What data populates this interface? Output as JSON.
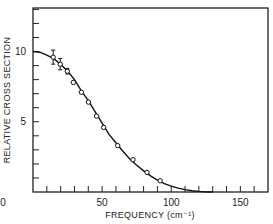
{
  "chart_data": {
    "type": "scatter",
    "title": "",
    "xlabel": "FREQUENCY (cm⁻¹)",
    "ylabel": "RELATIVE CROSS SECTION",
    "xlim": [
      0,
      170
    ],
    "ylim": [
      0,
      13.1
    ],
    "x_tick_labels": [
      "0",
      "50",
      "100",
      "150"
    ],
    "x_ticks": [
      0,
      50,
      100,
      150
    ],
    "x_minor_tick_step": 10,
    "y_tick_labels": [
      "0",
      "5",
      "10"
    ],
    "y_ticks": [
      0,
      5,
      10
    ],
    "y_minor_tick_step": 1,
    "grid": false,
    "legend": null,
    "series": [
      {
        "name": "measured",
        "marker": "open-circle",
        "x": [
          14.6,
          19.7,
          24.8,
          29.2,
          35.0,
          40.1,
          46.0,
          51.1,
          61.3,
          72.3,
          82.5,
          92.0
        ],
        "y": [
          9.6,
          9.1,
          8.6,
          7.8,
          7.1,
          6.4,
          5.4,
          4.6,
          3.3,
          2.3,
          1.4,
          0.8
        ],
        "error_bars": [
          0.5,
          0.4,
          0.2,
          0,
          0,
          0,
          0,
          0,
          0,
          0,
          0,
          0
        ]
      },
      {
        "name": "fit",
        "style": "solid-line",
        "x": [
          0,
          5,
          10,
          15,
          20,
          25,
          30,
          35,
          40,
          45,
          50,
          55,
          60,
          65,
          70,
          75,
          80,
          85,
          90,
          95,
          100,
          105,
          110,
          115,
          120,
          125,
          130
        ],
        "y": [
          10.0,
          9.95,
          9.75,
          9.5,
          9.1,
          8.6,
          8.0,
          7.2,
          6.5,
          5.7,
          4.9,
          4.1,
          3.5,
          2.9,
          2.35,
          1.9,
          1.5,
          1.15,
          0.85,
          0.6,
          0.42,
          0.28,
          0.17,
          0.09,
          0.04,
          0.01,
          0.0
        ]
      }
    ]
  }
}
